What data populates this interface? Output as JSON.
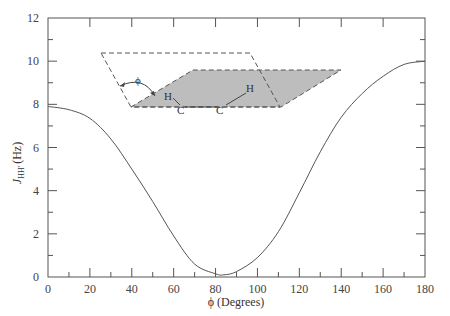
{
  "chart_data": {
    "type": "line",
    "title": "",
    "xlabel": "ϕ (Degrees)",
    "ylabel": "J_HH' (Hz)",
    "ylabel_main": "J",
    "ylabel_sub": "HH'",
    "ylabel_unit": "(Hz)",
    "xlim": [
      0,
      180
    ],
    "ylim": [
      0,
      12
    ],
    "grid": false,
    "legend": null,
    "x_ticks": [
      0,
      20,
      40,
      60,
      80,
      100,
      120,
      140,
      160,
      180
    ],
    "x_minor_ticks": [
      10,
      30,
      50,
      70,
      90,
      110,
      130,
      150,
      170
    ],
    "y_ticks": [
      0,
      2,
      4,
      6,
      8,
      10,
      12
    ],
    "y_minor_ticks": [
      1,
      3,
      5,
      7,
      9,
      11
    ],
    "series": [
      {
        "name": "Karplus curve",
        "color": "#555555",
        "x": [
          0,
          10,
          20,
          30,
          40,
          50,
          60,
          70,
          80,
          84,
          90,
          100,
          110,
          120,
          130,
          140,
          150,
          160,
          170,
          180
        ],
        "y": [
          7.9,
          7.75,
          7.35,
          6.4,
          5.0,
          3.5,
          1.9,
          0.6,
          0.15,
          0.1,
          0.25,
          0.9,
          2.1,
          3.9,
          5.8,
          7.4,
          8.5,
          9.3,
          9.85,
          10.0
        ]
      }
    ],
    "inset_diagram": {
      "description": "Two dashed planes (H-C-C and C-C-H) with dihedral angle ϕ",
      "angle_label": "ϕ",
      "atoms": [
        "H",
        "C",
        "C",
        "H"
      ],
      "shaded_plane_color": "#bbbbbb"
    }
  },
  "axes": {
    "x_tick_labels": [
      "0",
      "20",
      "40",
      "60",
      "80",
      "100",
      "120",
      "140",
      "160",
      "180"
    ],
    "y_tick_labels": [
      "0",
      "2",
      "4",
      "6",
      "8",
      "10",
      "12"
    ]
  }
}
